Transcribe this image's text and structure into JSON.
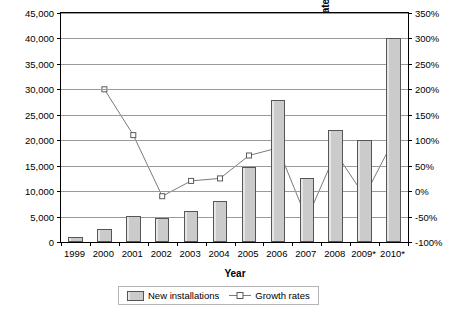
{
  "chart_data": {
    "type": "bar",
    "title": "",
    "xlabel": "Year",
    "ylabel": "New installations [units/a]",
    "ylabel_right": "Growth rates [%]",
    "categories": [
      "1999",
      "2000",
      "2001",
      "2002",
      "2003",
      "2004",
      "2005",
      "2006",
      "2007",
      "2008",
      "2009*",
      "2010*"
    ],
    "ylim": [
      0,
      45000
    ],
    "ylim_right": [
      -100,
      350
    ],
    "yticks": [
      "0",
      "5,000",
      "10,000",
      "15,000",
      "20,000",
      "25,000",
      "30,000",
      "35,000",
      "40,000",
      "45,000"
    ],
    "yticks_right": [
      "-100%",
      "-50%",
      "0%",
      "50%",
      "100%",
      "150%",
      "200%",
      "250%",
      "300%",
      "350%"
    ],
    "grid": true,
    "legend_position": "bottom",
    "series": [
      {
        "name": "New installations",
        "type": "bar",
        "axis": "left",
        "values": [
          1000,
          2500,
          5200,
          4800,
          6000,
          8000,
          14800,
          28000,
          12500,
          22000,
          20000,
          40000
        ]
      },
      {
        "name": "Growth rates",
        "type": "line",
        "axis": "right",
        "values": [
          null,
          200,
          110,
          -10,
          20,
          25,
          70,
          85,
          -55,
          75,
          -10,
          100
        ]
      }
    ]
  },
  "legend": {
    "items": [
      {
        "label": "New installations",
        "marker": "bar-swatch"
      },
      {
        "label": "Growth rates",
        "marker": "line-circle"
      }
    ]
  },
  "colors": {
    "bar_fill": "#cfcfcf",
    "bar_stroke": "#555555",
    "line": "#7a7a7a",
    "grid": "#9a9a9a",
    "axis": "#000000",
    "background": "#ffffff"
  }
}
